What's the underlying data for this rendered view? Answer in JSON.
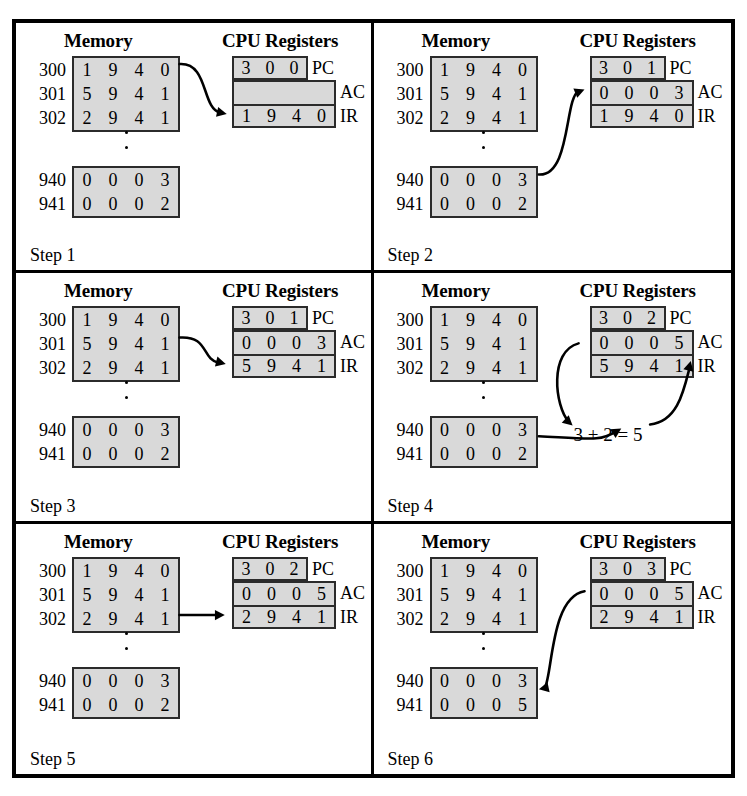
{
  "figure": {
    "kind": "instruction-execution-trace",
    "panel_count": 6,
    "colors": {
      "cell_fill": "#d9d9d9",
      "border": "#2b2b2b",
      "ink": "#000000",
      "background": "#ffffff"
    },
    "labels": {
      "memory_heading": "Memory",
      "cpu_heading": "CPU Registers",
      "pc": "PC",
      "ac": "AC",
      "ir": "IR"
    },
    "memory_addresses_top": [
      "300",
      "301",
      "302"
    ],
    "memory_addresses_bottom": [
      "940",
      "941"
    ],
    "icons": {
      "ellipsis": "vertical-ellipsis",
      "arrow": "curved-arrow",
      "arrowhead": "filled-triangle"
    }
  },
  "panels": [
    {
      "step_label": "Step 1",
      "memory_top": [
        [
          "1",
          "9",
          "4",
          "0"
        ],
        [
          "5",
          "9",
          "4",
          "1"
        ],
        [
          "2",
          "9",
          "4",
          "1"
        ]
      ],
      "memory_bottom": [
        [
          "0",
          "0",
          "0",
          "3"
        ],
        [
          "0",
          "0",
          "0",
          "2"
        ]
      ],
      "pc": [
        "3",
        "0",
        "0"
      ],
      "ac": [
        "",
        "",
        "",
        ""
      ],
      "ir": [
        "1",
        "9",
        "4",
        "0"
      ],
      "annotation": "",
      "arrows": [
        "memory-300-to-IR"
      ]
    },
    {
      "step_label": "Step 2",
      "memory_top": [
        [
          "1",
          "9",
          "4",
          "0"
        ],
        [
          "5",
          "9",
          "4",
          "1"
        ],
        [
          "2",
          "9",
          "4",
          "1"
        ]
      ],
      "memory_bottom": [
        [
          "0",
          "0",
          "0",
          "3"
        ],
        [
          "0",
          "0",
          "0",
          "2"
        ]
      ],
      "pc": [
        "3",
        "0",
        "1"
      ],
      "ac": [
        "0",
        "0",
        "0",
        "3"
      ],
      "ir": [
        "1",
        "9",
        "4",
        "0"
      ],
      "annotation": "",
      "arrows": [
        "memory-940-to-AC"
      ]
    },
    {
      "step_label": "Step 3",
      "memory_top": [
        [
          "1",
          "9",
          "4",
          "0"
        ],
        [
          "5",
          "9",
          "4",
          "1"
        ],
        [
          "2",
          "9",
          "4",
          "1"
        ]
      ],
      "memory_bottom": [
        [
          "0",
          "0",
          "0",
          "3"
        ],
        [
          "0",
          "0",
          "0",
          "2"
        ]
      ],
      "pc": [
        "3",
        "0",
        "1"
      ],
      "ac": [
        "0",
        "0",
        "0",
        "3"
      ],
      "ir": [
        "5",
        "9",
        "4",
        "1"
      ],
      "annotation": "",
      "arrows": [
        "memory-301-to-IR"
      ]
    },
    {
      "step_label": "Step 4",
      "memory_top": [
        [
          "1",
          "9",
          "4",
          "0"
        ],
        [
          "5",
          "9",
          "4",
          "1"
        ],
        [
          "2",
          "9",
          "4",
          "1"
        ]
      ],
      "memory_bottom": [
        [
          "0",
          "0",
          "0",
          "3"
        ],
        [
          "0",
          "0",
          "0",
          "2"
        ]
      ],
      "pc": [
        "3",
        "0",
        "2"
      ],
      "ac": [
        "0",
        "0",
        "0",
        "5"
      ],
      "ir": [
        "5",
        "9",
        "4",
        "1"
      ],
      "annotation": "3 + 2 = 5",
      "arrows": [
        "AC-to-adder",
        "memory-941-to-adder",
        "adder-to-AC"
      ]
    },
    {
      "step_label": "Step 5",
      "memory_top": [
        [
          "1",
          "9",
          "4",
          "0"
        ],
        [
          "5",
          "9",
          "4",
          "1"
        ],
        [
          "2",
          "9",
          "4",
          "1"
        ]
      ],
      "memory_bottom": [
        [
          "0",
          "0",
          "0",
          "3"
        ],
        [
          "0",
          "0",
          "0",
          "2"
        ]
      ],
      "pc": [
        "3",
        "0",
        "2"
      ],
      "ac": [
        "0",
        "0",
        "0",
        "5"
      ],
      "ir": [
        "2",
        "9",
        "4",
        "1"
      ],
      "annotation": "",
      "arrows": [
        "memory-302-to-IR"
      ]
    },
    {
      "step_label": "Step 6",
      "memory_top": [
        [
          "1",
          "9",
          "4",
          "0"
        ],
        [
          "5",
          "9",
          "4",
          "1"
        ],
        [
          "2",
          "9",
          "4",
          "1"
        ]
      ],
      "memory_bottom": [
        [
          "0",
          "0",
          "0",
          "3"
        ],
        [
          "0",
          "0",
          "0",
          "5"
        ]
      ],
      "pc": [
        "3",
        "0",
        "3"
      ],
      "ac": [
        "0",
        "0",
        "0",
        "5"
      ],
      "ir": [
        "2",
        "9",
        "4",
        "1"
      ],
      "annotation": "",
      "arrows": [
        "AC-to-memory-941"
      ]
    }
  ]
}
